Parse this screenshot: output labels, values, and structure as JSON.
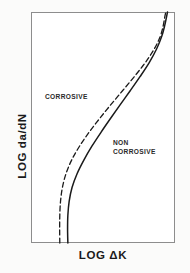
{
  "figure": {
    "background_color": "#fbfbfa",
    "plot_background_color": "#ffffff",
    "frame_color": "#8d8d8d"
  },
  "axes": {
    "y_title": "LOG  da/dN",
    "x_title": "LOG  ΔK"
  },
  "annotations": {
    "corrosive": "CORROSIVE",
    "non_corrosive": "NON\nCORROSIVE"
  },
  "chart_data": {
    "type": "line",
    "title": "",
    "subtitle": "",
    "xlabel": "LOG  ΔK",
    "ylabel": "LOG  da/dN",
    "xlim": [
      0,
      1
    ],
    "ylim": [
      0,
      1
    ],
    "grid": false,
    "ticks": {
      "x": [],
      "y": []
    },
    "legend": {
      "position": "in-plot-annotations",
      "entries": [
        "CORROSIVE",
        "NON CORROSIVE"
      ]
    },
    "series": [
      {
        "name": "CORROSIVE",
        "style": "dashed",
        "color": "#1a1a1a",
        "linewidth": 1.3,
        "dash_pattern": [
          5,
          3
        ],
        "x": [
          0.2,
          0.199,
          0.2,
          0.205,
          0.218,
          0.243,
          0.283,
          0.338,
          0.404,
          0.478,
          0.556,
          0.637,
          0.717,
          0.793,
          0.856,
          0.898,
          0.918,
          0.928,
          0.936
        ],
        "y": [
          0.0,
          0.06,
          0.12,
          0.18,
          0.24,
          0.3,
          0.36,
          0.42,
          0.48,
          0.54,
          0.6,
          0.66,
          0.72,
          0.78,
          0.84,
          0.895,
          0.94,
          0.975,
          1.0
        ]
      },
      {
        "name": "NON CORROSIVE",
        "style": "solid",
        "color": "#1a1a1a",
        "linewidth": 1.5,
        "x": [
          0.256,
          0.254,
          0.256,
          0.265,
          0.285,
          0.32,
          0.368,
          0.424,
          0.487,
          0.553,
          0.621,
          0.69,
          0.757,
          0.82,
          0.872,
          0.908,
          0.928,
          0.94,
          0.948
        ],
        "y": [
          0.0,
          0.06,
          0.12,
          0.18,
          0.24,
          0.3,
          0.36,
          0.42,
          0.48,
          0.54,
          0.6,
          0.66,
          0.72,
          0.78,
          0.84,
          0.895,
          0.94,
          0.975,
          1.0
        ]
      }
    ]
  }
}
